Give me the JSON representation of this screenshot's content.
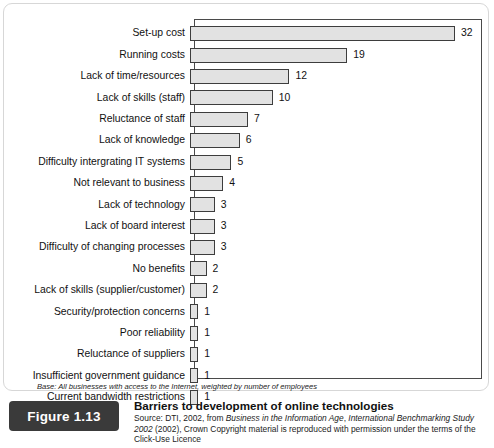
{
  "chart_data": {
    "type": "bar",
    "orientation": "horizontal",
    "title": "Barriers to development of online technologies",
    "xlabel": "",
    "ylabel": "",
    "xlim": [
      0,
      35
    ],
    "grid": false,
    "legend": null,
    "categories": [
      "Set-up cost",
      "Running costs",
      "Lack of time/resources",
      "Lack of skills (staff)",
      "Reluctance of staff",
      "Lack of knowledge",
      "Difficulty intergrating IT systems",
      "Not relevant to business",
      "Lack of technology",
      "Lack of board interest",
      "Difficulty of changing processes",
      "No benefits",
      "Lack of skills (supplier/customer)",
      "Security/protection concerns",
      "Poor reliability",
      "Reluctance of suppliers",
      "Insufficient government guidance",
      "Current bandwidth restrictions"
    ],
    "values": [
      32,
      19,
      12,
      10,
      7,
      6,
      5,
      4,
      3,
      3,
      3,
      2,
      2,
      1,
      1,
      1,
      1,
      1
    ],
    "bar_fill_color": "#e2e2e2",
    "bar_border_color": "#3d3d3d",
    "axis_color": "#4a4a4a"
  },
  "base_note": "Base: All businesses with access to the Internet, weighted by number of employees",
  "caption": {
    "figure_number": "Figure 1.13",
    "title": "Barriers to development of online technologies",
    "source_prefix": "Source:",
    "source_line1_a": " DTI, 2002, from ",
    "source_line1_b": "Business in the Information Age",
    "source_line1_c": ", ",
    "source_line1_d": "International Benchmarking Study",
    "source_line2_a": "2002",
    "source_line2_b": " (2002), Crown Copyright material is reproduced with permission under the terms of",
    "source_line3": "the Click-Use Licence"
  }
}
